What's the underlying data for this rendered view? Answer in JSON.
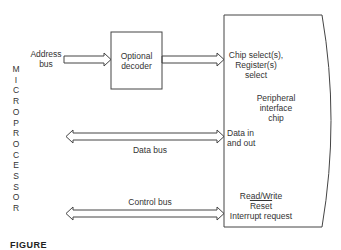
{
  "diagram": {
    "side_label": {
      "text": "MICROPROCESSOR",
      "letters": [
        "M",
        "I",
        "C",
        "R",
        "O",
        "P",
        "R",
        "O",
        "C",
        "E",
        "S",
        "S",
        "O",
        "R"
      ]
    },
    "nodes": [
      {
        "id": "decoder",
        "label_lines": [
          "Optional",
          "decoder"
        ]
      },
      {
        "id": "peripheral",
        "label_lines": [
          "Peripheral",
          "interface",
          "chip"
        ]
      }
    ],
    "buses": [
      {
        "id": "address_bus",
        "label_lines": [
          "Address",
          "bus"
        ],
        "direction": "to decoder"
      },
      {
        "id": "data_bus",
        "label": "Data bus",
        "direction": "bidirectional"
      },
      {
        "id": "control_bus",
        "label": "Control bus",
        "direction": "bidirectional"
      }
    ],
    "peripheral_ports": {
      "chip_select": [
        "Chip select(s),",
        "Register(s)",
        "select"
      ],
      "data": [
        "Data in",
        "and out"
      ],
      "control": [
        "Read/Write",
        "Reset",
        "Interrupt request"
      ]
    },
    "caption": "FIGURE"
  }
}
